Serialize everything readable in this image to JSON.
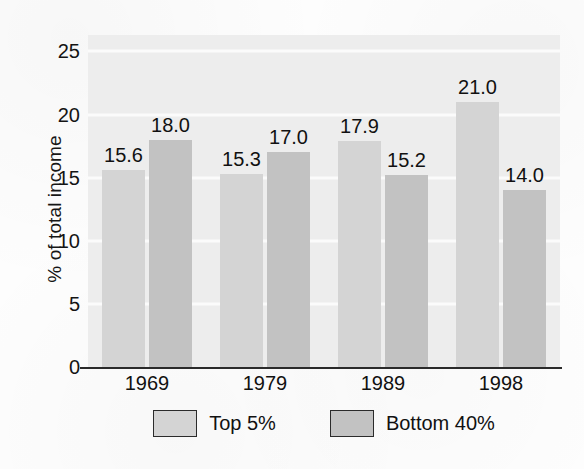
{
  "chart_data": {
    "type": "bar",
    "title": "",
    "subtitle": "",
    "xlabel": "",
    "ylabel": "% of total income",
    "categories": [
      "1969",
      "1979",
      "1989",
      "1998"
    ],
    "series": [
      {
        "name": "Top 5%",
        "color": "#d4d4d4",
        "values": [
          15.6,
          15.3,
          17.9,
          21.0
        ]
      },
      {
        "name": "Bottom 40%",
        "color": "#c2c2c2",
        "values": [
          18.0,
          17.0,
          15.2,
          14.0
        ]
      }
    ],
    "value_labels": [
      [
        "15.6",
        "15.3",
        "17.9",
        "21.0"
      ],
      [
        "18.0",
        "17.0",
        "15.2",
        "14.0"
      ]
    ],
    "ylim": [
      0,
      26.3
    ],
    "yticks": [
      0,
      5,
      10,
      15,
      20,
      25
    ],
    "ytick_labels": [
      "0",
      "5",
      "10",
      "15",
      "20",
      "25"
    ],
    "grid": true,
    "grid_color": "#fbfbfb",
    "plot_background": "#ededed",
    "legend_position": "bottom",
    "legend_entries": [
      "Top 5%",
      "Bottom 40%"
    ]
  }
}
